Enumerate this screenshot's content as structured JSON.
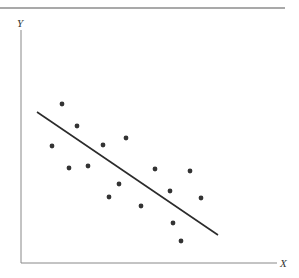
{
  "chart_data": {
    "type": "scatter",
    "title": "",
    "xlabel": "X",
    "ylabel": "Y",
    "grid": false,
    "legend": null,
    "axis_ticks": false,
    "points_px": [
      [
        62,
        104
      ],
      [
        77,
        126
      ],
      [
        52,
        146
      ],
      [
        103,
        145
      ],
      [
        126,
        138
      ],
      [
        69,
        168
      ],
      [
        88,
        166
      ],
      [
        119,
        184
      ],
      [
        109,
        197
      ],
      [
        155,
        169
      ],
      [
        190,
        171
      ],
      [
        170,
        191
      ],
      [
        201,
        198
      ],
      [
        141,
        206
      ],
      [
        173,
        223
      ],
      [
        181,
        241
      ]
    ],
    "regression_line_px": {
      "x1": 37,
      "y1": 112,
      "x2": 218,
      "y2": 235
    },
    "trend": "negative",
    "n_points": 16
  },
  "colors": {
    "axis": "#777777",
    "points": "#333333",
    "line": "#2b2b2b",
    "top_rule": "#555555"
  }
}
